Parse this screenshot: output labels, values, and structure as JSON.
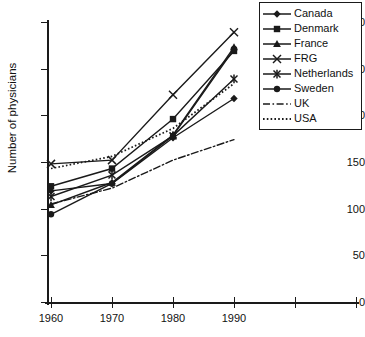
{
  "chart_data": {
    "type": "line",
    "title": "",
    "subtitle": "",
    "xlabel": "",
    "ylabel": "Number of physicians",
    "x": [
      1960,
      1970,
      1980,
      1990
    ],
    "xtick_labels": [
      "1960",
      "1970",
      "1980",
      "1990",
      "",
      ""
    ],
    "ytick_labels": [
      "0",
      "50",
      "100",
      "150",
      "200",
      "250",
      "300"
    ],
    "ytick_values": [
      0,
      50,
      100,
      150,
      200,
      250,
      300
    ],
    "ylim": [
      0,
      300
    ],
    "xlim": [
      1960,
      2010
    ],
    "grid": false,
    "legend_position": "top-right",
    "series": [
      {
        "name": "Canada",
        "marker": "diamond",
        "line": "solid",
        "values": [
          119,
          127,
          176,
          218
        ]
      },
      {
        "name": "Denmark",
        "marker": "square",
        "line": "solid",
        "values": [
          124,
          143,
          196,
          269
        ]
      },
      {
        "name": "France",
        "marker": "triangle",
        "line": "solid",
        "values": [
          104,
          128,
          179,
          273
        ]
      },
      {
        "name": "FRG",
        "marker": "cross",
        "line": "solid",
        "values": [
          148,
          152,
          222,
          289
        ]
      },
      {
        "name": "Netherlands",
        "marker": "asterisk",
        "line": "solid",
        "values": [
          113,
          136,
          178,
          239
        ]
      },
      {
        "name": "Sweden",
        "marker": "circle",
        "line": "solid",
        "values": [
          94,
          127,
          178,
          271
        ]
      },
      {
        "name": "UK",
        "marker": "none",
        "line": "dashdot",
        "values": [
          105,
          122,
          152,
          174
        ]
      },
      {
        "name": "USA",
        "marker": "none",
        "line": "dotted",
        "values": [
          143,
          156,
          186,
          234
        ]
      }
    ]
  },
  "colors": {
    "ink": "#1a1a1a",
    "background": "#ffffff"
  }
}
